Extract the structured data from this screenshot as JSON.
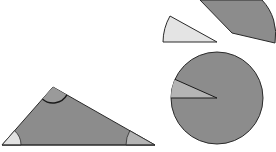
{
  "diagram": {
    "title": "",
    "colors": {
      "background": "#ffffff",
      "main_fill": "#8c8c8c",
      "stroke": "#2a2a2a",
      "top_angle_fill": "#9a9a9a",
      "left_angle_fill": "#e2e2e2",
      "right_angle_fill": "#b4b4b4",
      "light_sector_fill": "#e4e4e4",
      "circle_wedge_fill": "#b4b4b4"
    },
    "triangle": {
      "vertices": {
        "left": [
          2,
          145
        ],
        "top": [
          53,
          87
        ],
        "right": [
          155,
          145
        ]
      },
      "angle_marks": [
        "top",
        "left",
        "right"
      ]
    },
    "sectors": [
      {
        "name": "light-sector",
        "apex": [
          217,
          42
        ],
        "fill_key": "light_sector_fill"
      },
      {
        "name": "dark-sector",
        "apex": [
          232,
          33
        ],
        "fill_key": "main_fill"
      }
    ],
    "circle": {
      "center": [
        217,
        98
      ],
      "radius": 50,
      "wedge_start_deg": 180,
      "wedge_end_deg": 156
    }
  }
}
